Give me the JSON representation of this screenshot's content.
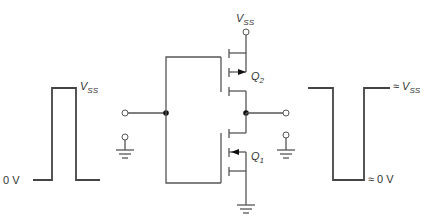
{
  "diagram": {
    "type": "CMOS inverter circuit",
    "supply_label": {
      "main": "V",
      "sub": "SS"
    },
    "transistors": [
      {
        "id": "Q2",
        "label": {
          "main": "Q",
          "sub": "2"
        },
        "type": "PMOS",
        "arrow": "outward"
      },
      {
        "id": "Q1",
        "label": {
          "main": "Q",
          "sub": "1"
        },
        "type": "NMOS",
        "arrow": "inward"
      }
    ],
    "input_waveform": {
      "high_label": {
        "main": "V",
        "sub": "SS"
      },
      "low_label": "0 V"
    },
    "output_waveform": {
      "high_label": {
        "prefix": "≈ ",
        "main": "V",
        "sub": "SS"
      },
      "low_label": "≈ 0 V"
    },
    "colors": {
      "wire": "#555555",
      "wave": "#444444",
      "text": "#333333",
      "dot": "#111111"
    }
  }
}
